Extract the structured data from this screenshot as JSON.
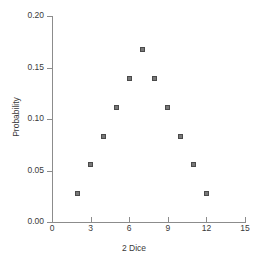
{
  "chart_data": {
    "type": "scatter",
    "title": "",
    "xlabel": "2 Dice",
    "ylabel": "Probability",
    "x": [
      2,
      3,
      4,
      5,
      6,
      7,
      8,
      9,
      10,
      11,
      12
    ],
    "values": [
      0.028,
      0.056,
      0.083,
      0.111,
      0.139,
      0.167,
      0.139,
      0.111,
      0.083,
      0.056,
      0.028
    ],
    "xlim": [
      0,
      15
    ],
    "ylim": [
      0,
      0.2
    ],
    "xticks": [
      0,
      3,
      6,
      9,
      12,
      15
    ],
    "xtick_labels": [
      "0",
      "3",
      "6",
      "9",
      "12",
      "15"
    ],
    "yticks": [
      0.0,
      0.05,
      0.1,
      0.15,
      0.2
    ],
    "ytick_labels": [
      "0.00",
      "0.05",
      "0.10",
      "0.15",
      "0.20"
    ],
    "grid": false,
    "legend": null,
    "marker_color": "#787878",
    "marker_edge_color": "#4a4a4a",
    "axis_color": "#8c8c8c",
    "text_color": "#3a3a3a",
    "background": "#ffffff"
  }
}
